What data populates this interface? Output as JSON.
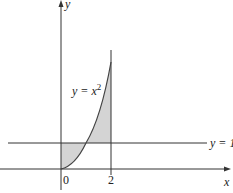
{
  "diagram": {
    "axes": {
      "x_label": "x",
      "y_label": "y",
      "origin_label": "0",
      "tick_label_2": "2"
    },
    "curve": {
      "label_main": "y = x",
      "label_exp": "2",
      "equation": "y = x^2"
    },
    "line": {
      "label": "y = 1"
    },
    "colors": {
      "axis": "#333333",
      "curve": "#444444",
      "shade": "#d4d4d4"
    }
  }
}
